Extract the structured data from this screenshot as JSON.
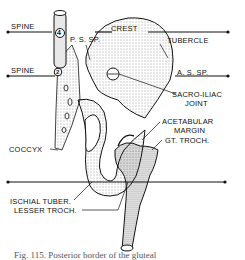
{
  "figure": {
    "labels": {
      "spine_top": "SPINE",
      "spine_mid": "SPINE",
      "crest": "CREST",
      "tubercle": "TUBERCLE",
      "psp": "P. S. SP.",
      "asp": "A. S. SP.",
      "sacroiliac": "SACRO-ILIAC",
      "joint": "JOINT",
      "acetabular": "ACETABULAR",
      "margin": "MARGIN",
      "gt_troch": "GT. TROCH.",
      "coccyx": "COCCYX",
      "ischial": "ISCHIAL TUBER.",
      "lesser": "LESSER TROCH.",
      "marker_4": "4",
      "marker_2": "2"
    },
    "caption": "Fig. 115. Posterior border of the gluteal"
  }
}
